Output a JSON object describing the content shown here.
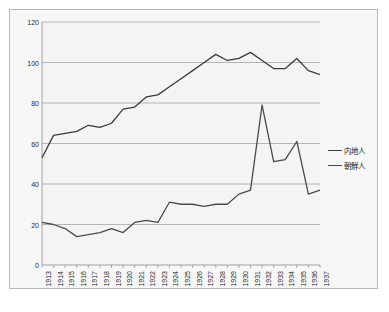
{
  "chart_data": {
    "type": "line",
    "title": "",
    "subtitle": "",
    "xlabel": "",
    "ylabel": "",
    "ylim": [
      0,
      120
    ],
    "ytick_labels": [
      "0",
      "20",
      "40",
      "60",
      "80",
      "100",
      "120"
    ],
    "yticks": [
      0,
      20,
      40,
      60,
      80,
      100,
      120
    ],
    "grid": true,
    "legend_position": "right",
    "categories": [
      "1913",
      "1914",
      "1915",
      "1916",
      "1917",
      "1918",
      "1919",
      "1920",
      "1921",
      "1922",
      "1923",
      "1924",
      "1925",
      "1926",
      "1927",
      "1928",
      "1929",
      "1930",
      "1931",
      "1932",
      "1933",
      "1934",
      "1935",
      "1936",
      "1937"
    ],
    "series": [
      {
        "name": "内地人",
        "color": "#3b3b3b",
        "values": [
          53,
          64,
          65,
          66,
          69,
          68,
          70,
          77,
          78,
          83,
          84,
          88,
          92,
          96,
          100,
          104,
          101,
          102,
          105,
          101,
          97,
          97,
          102,
          96,
          94
        ]
      },
      {
        "name": "朝鮮人",
        "color": "#4a4a4a",
        "values": [
          21,
          20,
          18,
          14,
          15,
          16,
          18,
          16,
          21,
          22,
          21,
          31,
          30,
          30,
          29,
          30,
          30,
          35,
          37,
          79,
          51,
          52,
          61,
          35,
          37
        ]
      }
    ]
  },
  "legend": {
    "items": [
      {
        "label": "内地人"
      },
      {
        "label": "朝鮮人"
      }
    ]
  }
}
